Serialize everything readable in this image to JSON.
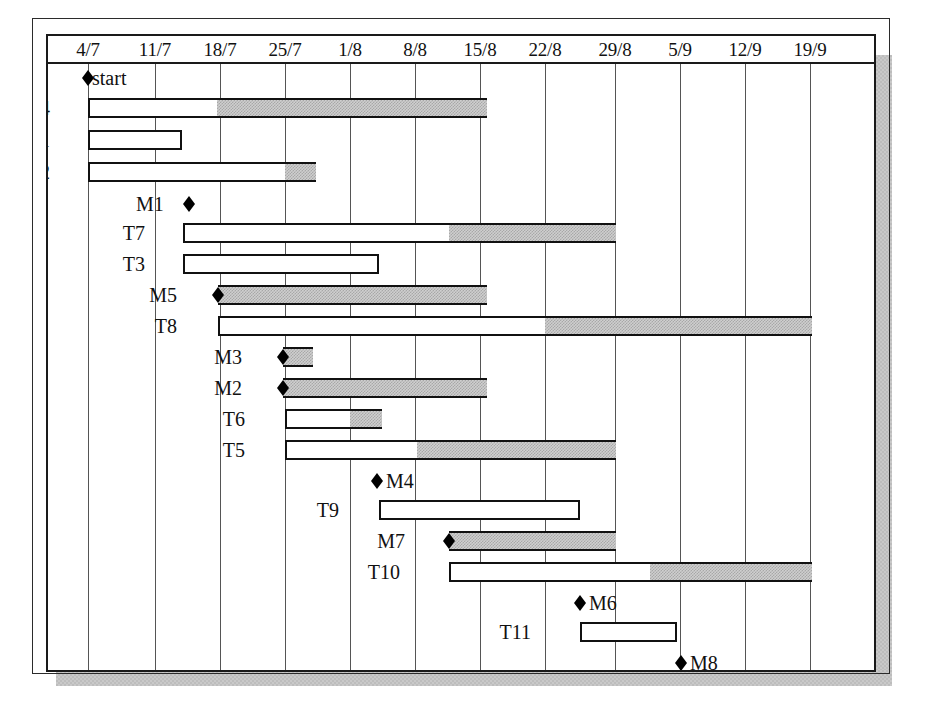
{
  "chart_data": {
    "type": "bar",
    "xlabel": "",
    "ylabel": "",
    "grid": true,
    "legend_position": "none",
    "axis": {
      "tick_labels": [
        "4/7",
        "11/7",
        "18/7",
        "25/7",
        "1/8",
        "8/8",
        "15/8",
        "22/8",
        "29/8",
        "5/9",
        "12/9",
        "19/9"
      ],
      "tick_pixels": [
        86,
        153,
        218,
        283,
        348,
        413,
        478,
        543,
        613,
        678,
        743,
        808
      ],
      "unit": "week",
      "range_start": "4/7",
      "range_end": "19/9"
    },
    "categories": [
      "T4",
      "T1",
      "T2",
      "T7",
      "T3",
      "M5",
      "T8",
      "M3",
      "M2",
      "T6",
      "T5",
      "T9",
      "M7",
      "T10",
      "T11",
      "T12"
    ],
    "milestones": [
      {
        "label": "start",
        "at": "4/7",
        "x": 86
      },
      {
        "label": "M1",
        "at": "16/7",
        "x": 187
      },
      {
        "label": "M5",
        "at": "18/7",
        "x": 217
      },
      {
        "label": "M3",
        "at": "25/7",
        "x": 282
      },
      {
        "label": "M2",
        "at": "25/7",
        "x": 282
      },
      {
        "label": "M4",
        "at": "3/8",
        "x": 375
      },
      {
        "label": "M7",
        "at": "8/8",
        "x": 448
      },
      {
        "label": "M6",
        "at": "25/8",
        "x": 578
      },
      {
        "label": "M8",
        "at": "2/9",
        "x": 679
      },
      {
        "label": "Finish",
        "at": "19/9",
        "x": 809
      }
    ],
    "bars": [
      {
        "name": "T4",
        "start": "4/7",
        "end": "14/8",
        "x": 86,
        "width": 399,
        "fill_start": 215,
        "label_x": 48
      },
      {
        "name": "T1",
        "start": "4/7",
        "end": "14/7",
        "x": 86,
        "width": 94,
        "fill_start": 180,
        "label_x": 48
      },
      {
        "name": "T2",
        "start": "4/7",
        "end": "28/7",
        "x": 86,
        "width": 228,
        "fill_start": 283,
        "label_x": 48
      },
      {
        "name": "T7",
        "start": "16/7",
        "end": "29/8",
        "x": 181,
        "width": 433,
        "fill_start": 447,
        "label_x": 143
      },
      {
        "name": "T3",
        "start": "16/7",
        "end": "3/8",
        "x": 181,
        "width": 196,
        "fill_start": 377,
        "label_x": 143
      },
      {
        "name": "M5",
        "start": "18/7",
        "end": "15/8",
        "x": 216,
        "width": 269,
        "fill_start": 216,
        "label_x": 175
      },
      {
        "name": "T8",
        "start": "18/7",
        "end": "19/9",
        "x": 216,
        "width": 594,
        "fill_start": 543,
        "label_x": 175
      },
      {
        "name": "M3",
        "start": "25/7",
        "end": "28/7",
        "x": 281,
        "width": 30,
        "fill_start": 281,
        "label_x": 240
      },
      {
        "name": "M2",
        "start": "25/7",
        "end": "15/8",
        "x": 281,
        "width": 204,
        "fill_start": 281,
        "label_x": 240
      },
      {
        "name": "T6",
        "start": "25/7",
        "end": "4/8",
        "x": 283,
        "width": 97,
        "fill_start": 348,
        "label_x": 243
      },
      {
        "name": "T5",
        "start": "25/7",
        "end": "29/8",
        "x": 283,
        "width": 331,
        "fill_start": 415,
        "label_x": 243
      },
      {
        "name": "T9",
        "start": "3/8",
        "end": "24/8",
        "x": 377,
        "width": 201,
        "fill_start": 578,
        "label_x": 337
      },
      {
        "name": "M7",
        "start": "8/8",
        "end": "29/8",
        "x": 447,
        "width": 167,
        "fill_start": 447,
        "label_x": 403
      },
      {
        "name": "T10",
        "start": "8/8",
        "end": "19/9",
        "x": 447,
        "width": 363,
        "fill_start": 648,
        "label_x": 398
      },
      {
        "name": "T11",
        "start": "22/8",
        "end": "5/9",
        "x": 578,
        "width": 97,
        "fill_start": 675,
        "label_x": 529
      },
      {
        "name": "T12",
        "start": "2/9",
        "end": "19/9",
        "x": 679,
        "width": 131,
        "fill_start": 810,
        "label_x": 630
      }
    ]
  },
  "rows": [
    {
      "kind": "marker",
      "name": "start",
      "label": "start",
      "diamond_x": 80,
      "text_x": 90,
      "top": 0
    },
    {
      "kind": "bar",
      "name": "T4",
      "label": "T4",
      "top": 30
    },
    {
      "kind": "bar",
      "name": "T1",
      "label": "T1",
      "top": 62
    },
    {
      "kind": "bar",
      "name": "T2",
      "label": "T2",
      "top": 94
    },
    {
      "kind": "marker",
      "name": "M1",
      "label": "M1",
      "diamond_x": 181,
      "text_x": 134,
      "top": 126
    },
    {
      "kind": "bar",
      "name": "T7",
      "label": "T7",
      "top": 155
    },
    {
      "kind": "bar",
      "name": "T3",
      "label": "T3",
      "top": 186
    },
    {
      "kind": "bar",
      "name": "M5",
      "label": "M5",
      "top": 217,
      "diamond_x": 210
    },
    {
      "kind": "bar",
      "name": "T8",
      "label": "T8",
      "top": 248
    },
    {
      "kind": "bar",
      "name": "M3",
      "label": "M3",
      "top": 279,
      "diamond_x": 275
    },
    {
      "kind": "bar",
      "name": "M2",
      "label": "M2",
      "top": 310,
      "diamond_x": 275
    },
    {
      "kind": "bar",
      "name": "T6",
      "label": "T6",
      "top": 341
    },
    {
      "kind": "bar",
      "name": "T5",
      "label": "T5",
      "top": 372
    },
    {
      "kind": "marker",
      "name": "M4",
      "label": "M4",
      "diamond_x": 369,
      "text_x": 384,
      "top": 403
    },
    {
      "kind": "bar",
      "name": "T9",
      "label": "T9",
      "top": 432
    },
    {
      "kind": "bar",
      "name": "M7",
      "label": "M7",
      "top": 463,
      "diamond_x": 441
    },
    {
      "kind": "bar",
      "name": "T10",
      "label": "T10",
      "top": 494
    },
    {
      "kind": "marker",
      "name": "M6",
      "label": "M6",
      "diamond_x": 572,
      "text_x": 587,
      "top": 525
    },
    {
      "kind": "bar",
      "name": "T11",
      "label": "T11",
      "top": 554
    },
    {
      "kind": "marker",
      "name": "M8",
      "label": "M8",
      "diamond_x": 673,
      "text_x": 688,
      "top": 585
    },
    {
      "kind": "bar",
      "name": "T12",
      "label": "T12",
      "top": 614
    },
    {
      "kind": "marker",
      "name": "Finish",
      "label": "Finish",
      "diamond_x": 803,
      "text_x": 813,
      "top": 645
    }
  ],
  "colors": {
    "bar_outline": "#111111",
    "bar_empty": "#ffffff",
    "bar_progress": "#cfcfcf",
    "frame": "#1a1a1a",
    "gridline": "#555555",
    "shadow": "#c9c9c9"
  }
}
